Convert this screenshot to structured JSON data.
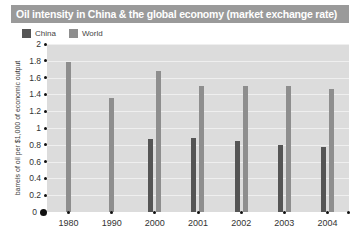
{
  "title": "Oil intensity in China & the global economy (market exchange rate)",
  "legend": {
    "items": [
      {
        "label": "China",
        "color": "#555555",
        "swatch_name": "legend-swatch-china"
      },
      {
        "label": "World",
        "color": "#8e8e8e",
        "swatch_name": "legend-swatch-world"
      }
    ]
  },
  "y_axis": {
    "title": "barrels of oil per $1,000 of economic output",
    "ticks": [
      "2",
      "1.8",
      "1.6",
      "1.4",
      "1.2",
      "1",
      "0.8",
      "0.6",
      "0.4",
      "0.2",
      "0"
    ]
  },
  "x_axis": {
    "ticks": [
      "1980",
      "1990",
      "2000",
      "2001",
      "2002",
      "2003",
      "2004"
    ]
  },
  "source_note": "Source: BP / Dow Chemical",
  "chart_data": {
    "type": "bar",
    "title": "Oil intensity in China & the global economy (market exchange rate)",
    "xlabel": "",
    "ylabel": "barrels of oil per $1,000 of economic output",
    "ylim": [
      0,
      2
    ],
    "ytick_step": 0.2,
    "grid": true,
    "legend_position": "top-left",
    "categories": [
      "1980",
      "1990",
      "2000",
      "2001",
      "2002",
      "2003",
      "2004"
    ],
    "series": [
      {
        "name": "China",
        "color": "#555555",
        "values": [
          null,
          null,
          0.87,
          0.88,
          0.85,
          0.8,
          0.77
        ]
      },
      {
        "name": "World",
        "color": "#8e8e8e",
        "values": [
          1.78,
          1.36,
          1.68,
          1.5,
          1.5,
          1.5,
          1.46
        ]
      }
    ]
  }
}
